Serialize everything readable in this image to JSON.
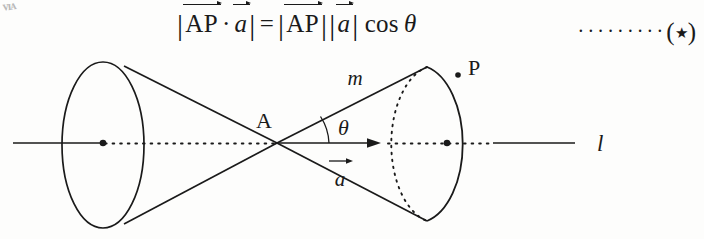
{
  "page": {
    "background": "#fdfdfc",
    "ink": "#1a1a1a",
    "bleed_mark": "ᴠɪᴀ"
  },
  "formula": {
    "statement_plain": "|AP⃗ · a⃗| = |AP⃗| |a⃗| cos θ",
    "left_bar": "|",
    "vec_ap": "AP",
    "dot_operator": "·",
    "vec_a": "a",
    "right_bar": "|",
    "equals": "=",
    "cos": "cos",
    "theta": "θ",
    "tag": {
      "leader_dots": "·········",
      "open_paren": "(",
      "star": "★",
      "close_paren": ")"
    }
  },
  "figure": {
    "type": "double-cone-vector-diagram",
    "labels": {
      "apex": "A",
      "angle": "θ",
      "slant_line": "m",
      "vector": "a",
      "point_on_rim": "P",
      "axis_line": "l"
    },
    "geometry": {
      "apex": [
        277,
        143
      ],
      "axis_y": 143,
      "axis_left_end": 13,
      "axis_right_end": 575,
      "left_ellipse": {
        "cx": 103,
        "cy": 145,
        "rx": 41,
        "ry": 83
      },
      "right_ellipse": {
        "cx": 447,
        "cy": 144,
        "rx": 46,
        "ry": 79
      },
      "right_rim_point_P": [
        458,
        74
      ],
      "vector_arrow_tip": [
        381,
        143
      ],
      "angle_arc_radius": 52
    },
    "strokes": {
      "solid": "cone outlines, left ellipse, axis ends, front arc of right ellipse",
      "dotted": "axis between centers, back arc of right ellipse"
    }
  }
}
